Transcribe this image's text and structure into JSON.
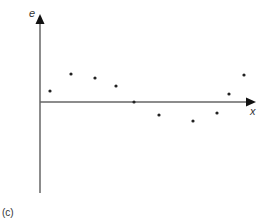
{
  "chart_data": {
    "type": "scatter",
    "title": "",
    "xlabel": "x",
    "ylabel": "e",
    "panel_label": "(c)",
    "grid": false,
    "legend": null,
    "axis_color": "#555555",
    "point_color": "#222222",
    "points": [
      {
        "x": 1,
        "y": 0.55
      },
      {
        "x": 2,
        "y": 1.35
      },
      {
        "x": 3,
        "y": 1.15
      },
      {
        "x": 4,
        "y": 0.75
      },
      {
        "x": 5,
        "y": 0.0
      },
      {
        "x": 6,
        "y": -0.6
      },
      {
        "x": 7,
        "y": -0.9
      },
      {
        "x": 8,
        "y": -0.55
      },
      {
        "x": 9,
        "y": 0.35
      },
      {
        "x": 10,
        "y": 1.3
      }
    ],
    "pixel_points": [
      [
        50,
        91
      ],
      [
        71,
        74
      ],
      [
        95,
        78
      ],
      [
        116,
        86
      ],
      [
        134,
        102
      ],
      [
        159,
        115
      ],
      [
        193,
        121
      ],
      [
        217,
        113
      ],
      [
        229,
        94
      ],
      [
        244,
        75
      ]
    ]
  }
}
